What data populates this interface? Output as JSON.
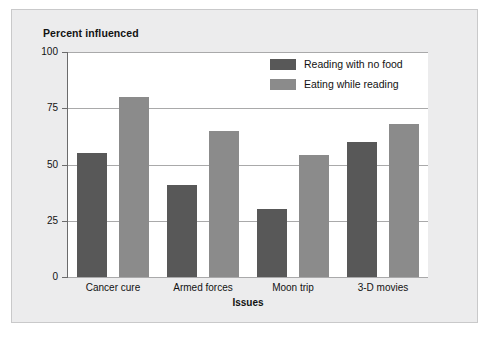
{
  "chart_data": {
    "type": "bar",
    "title": "Percent influenced",
    "xlabel": "Issues",
    "ylabel": "Percent influenced",
    "categories": [
      "Cancer cure",
      "Armed forces",
      "Moon trip",
      "3-D movies"
    ],
    "series": [
      {
        "name": "Reading with no food",
        "color": "#585858",
        "values": [
          55,
          41,
          30,
          60
        ]
      },
      {
        "name": "Eating while reading",
        "color": "#8b8b8b",
        "values": [
          80,
          65,
          54,
          68
        ]
      }
    ],
    "ylim": [
      0,
      100
    ],
    "yticks": [
      0,
      25,
      50,
      75,
      100
    ],
    "ytick_labels": [
      "0",
      "25",
      "50",
      "75",
      "100"
    ],
    "grid": "horizontal",
    "legend_position": "top-right-inside"
  },
  "colors": {
    "series_dark": "#585858",
    "series_light": "#8b8b8b",
    "panel_background": "#ececed",
    "plot_background": "#ffffff",
    "gridline": "#a9a9aa",
    "axis": "#6b6b6c",
    "text": "#121212"
  }
}
